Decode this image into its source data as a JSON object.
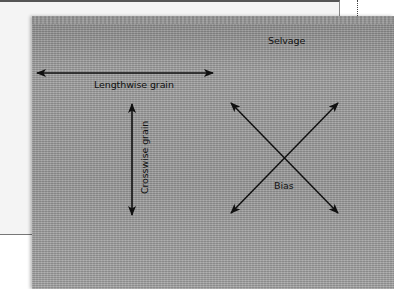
{
  "diagram": {
    "labels": {
      "selvage": "Selvage",
      "lengthwise": "Lengthwise grain",
      "crosswise": "Crosswise grain",
      "bias": "Bias"
    },
    "arrows": [
      {
        "name": "lengthwise",
        "from": [
          37,
          73
        ],
        "to": [
          213,
          73
        ],
        "double_headed": true
      },
      {
        "name": "crosswise",
        "from": [
          132,
          104
        ],
        "to": [
          132,
          215
        ],
        "double_headed": true
      },
      {
        "name": "bias-1",
        "from": [
          231,
          103
        ],
        "to": [
          338,
          213
        ],
        "double_headed": true
      },
      {
        "name": "bias-2",
        "from": [
          338,
          103
        ],
        "to": [
          231,
          213
        ],
        "double_headed": true
      }
    ],
    "colors": {
      "fabric": "#9a9a9a",
      "arrow": "#111111",
      "page": "#f4f4f4"
    }
  }
}
